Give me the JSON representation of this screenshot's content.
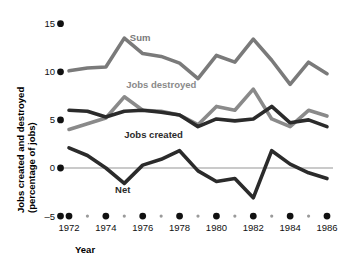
{
  "chart_data": {
    "type": "line",
    "title": "",
    "xlabel": "Year",
    "ylabel": "Jobs created and destroyed (percentage of jobs)",
    "ylabel_line1": "Jobs created and destroyed",
    "ylabel_line2": "(percentage of jobs)",
    "x": [
      1972,
      1973,
      1974,
      1975,
      1976,
      1977,
      1978,
      1979,
      1980,
      1981,
      1982,
      1983,
      1984,
      1985,
      1986
    ],
    "xlim": [
      1972,
      1986
    ],
    "ylim": [
      -5,
      15
    ],
    "yticks": [
      -5,
      0,
      5,
      10,
      15
    ],
    "ytick_labels": [
      "–5",
      "0",
      "5",
      "10",
      "15"
    ],
    "xticks_major": [
      1972,
      1974,
      1976,
      1978,
      1980,
      1982,
      1984,
      1986
    ],
    "xticks_minor": [
      1973,
      1975,
      1977,
      1979,
      1981,
      1983,
      1985
    ],
    "xtick_labels": [
      "1972",
      "1974",
      "1976",
      "1978",
      "1980",
      "1982",
      "1984",
      "1986"
    ],
    "grid": false,
    "legend_position": "inline-labels",
    "zero_line": 0,
    "series": [
      {
        "name": "Sum",
        "label": "Sum",
        "color": "#7a7a7a",
        "values": [
          10.1,
          10.4,
          10.5,
          13.5,
          11.9,
          11.6,
          10.9,
          9.3,
          11.7,
          11.0,
          13.4,
          11.2,
          8.7,
          11.0,
          9.8
        ]
      },
      {
        "name": "Jobs destroyed",
        "label": "Jobs destroyed",
        "color": "#8a8a8a",
        "values": [
          4.0,
          4.6,
          5.2,
          7.4,
          6.0,
          5.9,
          5.5,
          4.5,
          6.4,
          6.0,
          8.2,
          5.1,
          4.3,
          6.0,
          5.4
        ]
      },
      {
        "name": "Jobs created",
        "label": "Jobs created",
        "color": "#2b2b2b",
        "values": [
          6.0,
          5.9,
          5.3,
          5.9,
          6.0,
          5.8,
          5.5,
          4.3,
          5.1,
          4.9,
          5.1,
          6.4,
          4.7,
          5.0,
          4.3
        ]
      },
      {
        "name": "Net",
        "label": "Net",
        "color": "#2b2b2b",
        "values": [
          2.1,
          1.3,
          0.0,
          -1.6,
          0.3,
          0.9,
          1.8,
          -0.3,
          -1.4,
          -1.1,
          -3.1,
          1.8,
          0.4,
          -0.5,
          -1.1
        ]
      }
    ],
    "series_label_positions": [
      {
        "name": "Sum",
        "x": 1975.3,
        "y": 13.2
      },
      {
        "name": "Jobs destroyed",
        "x": 1975.1,
        "y": 8.3
      },
      {
        "name": "Jobs created",
        "x": 1975.0,
        "y": 3.1
      },
      {
        "name": "Net",
        "x": 1974.5,
        "y": -2.6
      }
    ]
  }
}
